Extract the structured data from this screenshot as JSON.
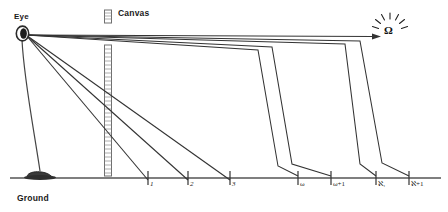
{
  "diagram": {
    "labels": {
      "eye": "Eye",
      "canvas": "Canvas",
      "ground": "Ground",
      "target": "Ω"
    },
    "icons": {
      "eye": "eye-icon",
      "canvas": "ruler-icon",
      "omega": "omega-starburst-icon",
      "arrow": "arrowhead-icon",
      "pedestal": "pedestal-icon"
    },
    "colors": {
      "stroke": "#333333",
      "text": "#1a1a1a",
      "ground": "#555555",
      "canvas": "#777777",
      "pedestal": "#3b3b3b",
      "background": "#ffffff"
    },
    "axis": {
      "y": 178,
      "x_start": 10,
      "x_end": 441,
      "ticks": [
        {
          "label": "1",
          "x": 148,
          "italic": true
        },
        {
          "label": "2",
          "x": 188,
          "italic": true
        },
        {
          "label": "3",
          "x": 230,
          "italic": true
        },
        {
          "label": "ω",
          "x": 298,
          "italic": false
        },
        {
          "label": "ω+1",
          "x": 331,
          "italic": false
        },
        {
          "label": "ℵ₁",
          "x": 376,
          "italic": false
        },
        {
          "label": "ℵ+1",
          "x": 409,
          "italic": false
        }
      ]
    },
    "eye": {
      "x": 23,
      "y": 33
    },
    "canvas_bar": {
      "x": 108,
      "top_segment": [
        10,
        23
      ],
      "bottom_segment": [
        45,
        176
      ]
    },
    "omega": {
      "x": 390,
      "y": 30
    },
    "ray_count": 7
  }
}
